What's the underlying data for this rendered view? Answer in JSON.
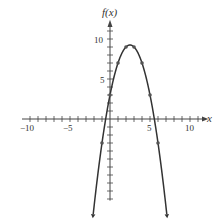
{
  "chart_data": {
    "type": "line",
    "title": "",
    "xlabel": "x",
    "ylabel": "f(x)",
    "function": "f(x) = -x^2 + 5x + 3",
    "xlim": [
      -11,
      12
    ],
    "ylim": [
      -11,
      12
    ],
    "x_ticks": [
      -10,
      -5,
      5,
      10
    ],
    "y_ticks": [
      5,
      10
    ],
    "grid": false,
    "points": [
      {
        "x": -1,
        "y": -3
      },
      {
        "x": 0,
        "y": 3
      },
      {
        "x": 1,
        "y": 7
      },
      {
        "x": 2,
        "y": 9
      },
      {
        "x": 3,
        "y": 9
      },
      {
        "x": 4,
        "y": 7
      },
      {
        "x": 5,
        "y": 3
      },
      {
        "x": 6,
        "y": -3
      }
    ],
    "vertex": {
      "x": 2.5,
      "y": 9.25
    },
    "curve_x_range": [
      -2.1,
      7.1
    ]
  },
  "labels": {
    "x_axis": "x",
    "y_axis": "f(x)",
    "tick_neg10": "−10",
    "tick_neg5": "−5",
    "tick_5x": "5",
    "tick_10x": "10",
    "tick_5y": "5",
    "tick_10y": "10"
  }
}
